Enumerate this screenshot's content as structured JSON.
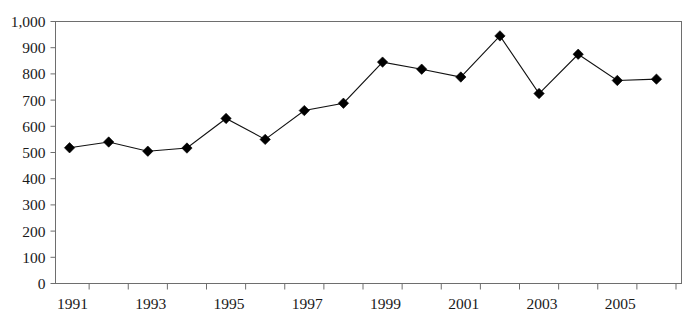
{
  "chart_data": {
    "type": "line",
    "title": "",
    "subtitle": "",
    "xlabel": "",
    "ylabel": "",
    "x": [
      1991,
      1992,
      1993,
      1994,
      1995,
      1996,
      1997,
      1998,
      1999,
      2000,
      2001,
      2002,
      2003,
      2004,
      2005,
      2006
    ],
    "categories": [
      "1991",
      "1992",
      "1993",
      "1994",
      "1995",
      "1996",
      "1997",
      "1998",
      "1999",
      "2000",
      "2001",
      "2002",
      "2003",
      "2004",
      "2005",
      "2006"
    ],
    "values": [
      518,
      540,
      505,
      517,
      630,
      550,
      660,
      688,
      845,
      818,
      788,
      945,
      725,
      875,
      775,
      780
    ],
    "series": [
      {
        "name": "",
        "marker": "diamond",
        "color": "#000000",
        "values": [
          518,
          540,
          505,
          517,
          630,
          550,
          660,
          688,
          845,
          818,
          788,
          945,
          725,
          875,
          775,
          780
        ]
      }
    ],
    "ylim": [
      0,
      1000
    ],
    "xlim": [
      1990.5,
      2006.5
    ],
    "y_ticks": [
      0,
      100,
      200,
      300,
      400,
      500,
      600,
      700,
      800,
      900,
      1000
    ],
    "y_tick_labels": [
      "0",
      "100",
      "200",
      "300",
      "400",
      "500",
      "600",
      "700",
      "800",
      "900",
      "1,000"
    ],
    "x_ticks": [
      1991,
      1992,
      1993,
      1994,
      1995,
      1996,
      1997,
      1998,
      1999,
      2000,
      2001,
      2002,
      2003,
      2004,
      2005,
      2006
    ],
    "x_tick_labels": [
      "1991",
      "",
      "1993",
      "",
      "1995",
      "",
      "1997",
      "",
      "1999",
      "",
      "2001",
      "",
      "2003",
      "",
      "2005",
      ""
    ],
    "x_visible_labels": [
      "1991",
      "1993",
      "1995",
      "1997",
      "1999",
      "2001",
      "2003",
      "2005"
    ],
    "grid": false,
    "legend": false,
    "legend_position": "none"
  },
  "axes": {
    "frame_color": "#6e6e6e",
    "line_color": "#111111",
    "marker_color": "#000000",
    "background": "#ffffff"
  }
}
